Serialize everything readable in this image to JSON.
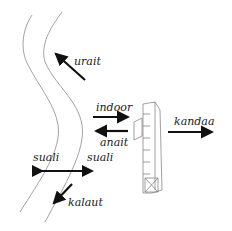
{
  "diagram": {
    "labels": {
      "urait": "urait",
      "indoor": "indoor",
      "anait": "anait",
      "kandaa": "kandaa",
      "suali_left": "suali",
      "suali_right": "suali",
      "kalaut": "kalaut"
    },
    "colors": {
      "river_line": "#8a8a8a",
      "arrow": "#111111",
      "house_line": "#777777"
    }
  }
}
